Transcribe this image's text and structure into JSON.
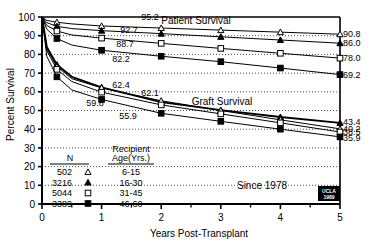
{
  "chart_data": {
    "type": "line",
    "title": "",
    "xlabel": "Years Post-Transplant",
    "ylabel": "Percent Survival",
    "xlim": [
      0,
      5
    ],
    "ylim": [
      0,
      100
    ],
    "xticks": [
      "0",
      "1",
      "2",
      "3",
      "4",
      "5"
    ],
    "yticks": [
      "0",
      "10",
      "20",
      "30",
      "40",
      "50",
      "60",
      "70",
      "80",
      "90",
      "100"
    ],
    "grid": "horizontal-dotted",
    "legend_position": "inside-lower-left",
    "annotations": {
      "patient_survival": "Patient Survival",
      "graft_survival": "Graft Survival",
      "since": "Since 1978",
      "logo_line1": "UCLA",
      "logo_line2": "1989"
    },
    "legend": {
      "header_n": "N",
      "header_age_line1": "Recipient",
      "header_age_line2": "Age(Yrs.)",
      "rows": [
        {
          "n": "502",
          "marker": "open-triangle",
          "age": "6-15"
        },
        {
          "n": "3216",
          "marker": "filled-triangle",
          "age": "16-30"
        },
        {
          "n": "5044",
          "marker": "open-square",
          "age": "31-45"
        },
        {
          "n": "3389",
          "marker": "filled-square",
          "age": "46-60"
        }
      ]
    },
    "groups": [
      {
        "name": "Patient Survival 6-15",
        "marker": "open-triangle",
        "x": [
          0,
          0.08,
          0.25,
          0.5,
          1,
          2,
          3,
          4,
          5
        ],
        "y": [
          100,
          98.2,
          97.2,
          96.3,
          95.2,
          94.1,
          93.0,
          91.9,
          90.8
        ],
        "label_1yr": "95.2",
        "label_5yr": "90.8"
      },
      {
        "name": "Patient Survival 16-30",
        "marker": "filled-triangle",
        "x": [
          0,
          0.08,
          0.25,
          0.5,
          1,
          2,
          3,
          4,
          5
        ],
        "y": [
          100,
          97.0,
          95.0,
          93.8,
          92.7,
          91.1,
          89.4,
          87.7,
          86.0
        ],
        "label_1yr": "92.7",
        "label_5yr": "86.0"
      },
      {
        "name": "Patient Survival 31-45",
        "marker": "open-square",
        "x": [
          0,
          0.08,
          0.25,
          0.5,
          1,
          2,
          3,
          4,
          5
        ],
        "y": [
          100,
          95.5,
          92.5,
          90.4,
          88.7,
          85.9,
          83.2,
          80.6,
          78.0
        ],
        "label_1yr": "88.7",
        "label_5yr": "78.0"
      },
      {
        "name": "Patient Survival 46-60",
        "marker": "filled-square",
        "x": [
          0,
          0.08,
          0.25,
          0.5,
          1,
          2,
          3,
          4,
          5
        ],
        "y": [
          100,
          93.5,
          88.5,
          85.0,
          82.2,
          79.0,
          76.1,
          72.7,
          69.2
        ],
        "label_1yr": "82.2",
        "label_5yr": "69.2"
      },
      {
        "name": "Graft Survival 16-30",
        "marker": "filled-triangle",
        "x": [
          0,
          0.08,
          0.25,
          0.5,
          1,
          2,
          3,
          4,
          5
        ],
        "y": [
          100,
          84.0,
          74.5,
          68.0,
          62.4,
          54.5,
          50.2,
          46.5,
          43.4
        ],
        "label_1yr": "62.4",
        "label_5yr": "43.4"
      },
      {
        "name": "Graft Survival 6-15",
        "marker": "open-triangle",
        "x": [
          0,
          0.08,
          0.25,
          0.5,
          1,
          2,
          3,
          4,
          5
        ],
        "y": [
          100,
          83.0,
          73.5,
          67.0,
          62.1,
          55.2,
          50.0,
          45.0,
          40.2
        ],
        "label_1yr": "62.1",
        "label_5yr": "40.2"
      },
      {
        "name": "Graft Survival 31-45",
        "marker": "open-square",
        "x": [
          0,
          0.08,
          0.25,
          0.5,
          1,
          2,
          3,
          4,
          5
        ],
        "y": [
          100,
          82.0,
          72.0,
          65.5,
          59.8,
          53.0,
          48.2,
          43.4,
          38.5
        ],
        "label_1yr": "59.8",
        "label_5yr": "38.5"
      },
      {
        "name": "Graft Survival 46-60",
        "marker": "filled-square",
        "x": [
          0,
          0.08,
          0.25,
          0.5,
          1,
          2,
          3,
          4,
          5
        ],
        "y": [
          100,
          79.0,
          68.0,
          61.0,
          55.9,
          48.5,
          44.2,
          40.0,
          35.9
        ],
        "label_1yr": "55.9",
        "label_5yr": "35.9"
      }
    ],
    "right_labels": [
      "90.8",
      "86.0",
      "78.0",
      "69.2",
      "43.4",
      "40.2",
      "38.5",
      "35.9"
    ],
    "inline_labels": [
      "95.2",
      "92.7",
      "88.7",
      "82.2",
      "62.4",
      "62.1",
      "59.8",
      "55.9"
    ]
  }
}
